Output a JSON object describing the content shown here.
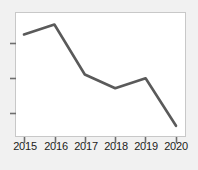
{
  "chart_data": {
    "type": "line",
    "title": "",
    "xlabel": "",
    "ylabel": "",
    "categories": [
      "2015",
      "2016",
      "2017",
      "2018",
      "2019",
      "2020"
    ],
    "x": [
      2015,
      2016,
      2017,
      2018,
      2019,
      2020
    ],
    "values": [
      82,
      90,
      50,
      39,
      47,
      9
    ],
    "series": [
      {
        "name": "",
        "values": [
          82,
          90,
          50,
          39,
          47,
          9
        ]
      }
    ],
    "ylim": [
      0,
      100
    ],
    "yticks": [
      25,
      50,
      75
    ],
    "grid": false,
    "legend": false,
    "legend_position": "none",
    "line_color": "#5a5a5a",
    "line_width": 2.6,
    "markers": false,
    "plot_background": "#ffffff",
    "figure_background": "#f1f1f1",
    "axis_color": "#8c8c8c",
    "tick_label_color": "#1c1c1c",
    "annotations": []
  },
  "axes": {
    "x_tick_labels": [
      "2015",
      "2016",
      "2017",
      "2018",
      "2019",
      "2020"
    ],
    "y_tick_labels": [
      "",
      "",
      ""
    ]
  }
}
